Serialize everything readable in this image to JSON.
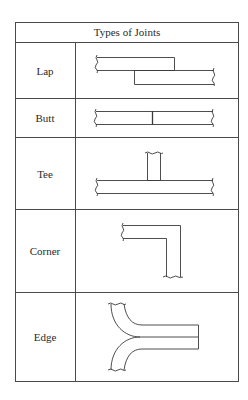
{
  "table": {
    "title": "Types of Joints",
    "rows": [
      {
        "label": "Lap",
        "diagram": "lap-joint"
      },
      {
        "label": "Butt",
        "diagram": "butt-joint"
      },
      {
        "label": "Tee",
        "diagram": "tee-joint"
      },
      {
        "label": "Corner",
        "diagram": "corner-joint"
      },
      {
        "label": "Edge",
        "diagram": "edge-joint"
      }
    ]
  },
  "colors": {
    "line": "#4a4a4a",
    "text": "#2a2a2a",
    "background": "#ffffff"
  }
}
